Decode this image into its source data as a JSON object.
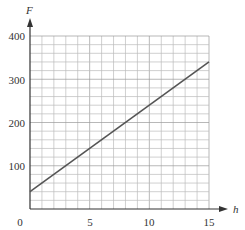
{
  "chart_data": {
    "type": "line",
    "title": "",
    "xlabel": "h",
    "ylabel": "F",
    "xlim": [
      0,
      15
    ],
    "ylim": [
      0,
      400
    ],
    "xticks": [
      0,
      5,
      10,
      15
    ],
    "xtick_labels": [
      "0",
      "5",
      "10",
      "15"
    ],
    "yticks": [
      100,
      200,
      300,
      400
    ],
    "ytick_labels": [
      "100",
      "200",
      "300",
      "400"
    ],
    "origin_label": "0",
    "grid": true,
    "grid_x_step": 1,
    "grid_y_step": 20,
    "series": [
      {
        "name": "F(h)",
        "x": [
          0,
          15
        ],
        "y": [
          40,
          340
        ],
        "color": "#555555"
      }
    ]
  },
  "labels": {
    "x_axis": "h",
    "y_axis": "F",
    "origin": "0",
    "x5": "5",
    "x10": "10",
    "x15": "15",
    "y100": "100",
    "y200": "200",
    "y300": "300",
    "y400": "400"
  }
}
